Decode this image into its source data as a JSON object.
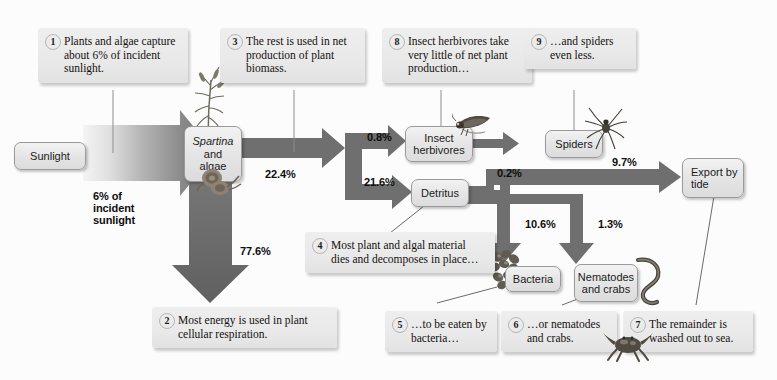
{
  "diagram": {
    "colors": {
      "arrow_dark": "#6b6b6b",
      "arrow_mid": "#7d7d7d",
      "node_fill": "#e7e7e7",
      "node_border": "#9a9a9a",
      "callout_fill": "#e9e9e9",
      "text": "#1b1b1b",
      "background": "#fcfcfc"
    }
  },
  "nodes": [
    {
      "id": "sunlight",
      "label": "Sunlight"
    },
    {
      "id": "spartina",
      "label_italic": "Spartina",
      "label_rest": "and algae"
    },
    {
      "id": "insects",
      "label": "Insect herbivores"
    },
    {
      "id": "spiders",
      "label": "Spiders"
    },
    {
      "id": "detritus",
      "label": "Detritus"
    },
    {
      "id": "export",
      "label": "Export by tide"
    },
    {
      "id": "bacteria",
      "label": "Bacteria"
    },
    {
      "id": "nematodes",
      "label": "Nematodes and crabs"
    }
  ],
  "flows": [
    {
      "id": "sunlight-to-plants",
      "label": "6% of\nincident\nsunlight",
      "from": "sunlight",
      "to": "spartina"
    },
    {
      "id": "net-production",
      "label": "22.4%",
      "from": "spartina",
      "to": "split"
    },
    {
      "id": "respiration",
      "label": "77.6%",
      "from": "spartina",
      "to": "respiration"
    },
    {
      "id": "to-insects",
      "label": "0.8%",
      "from": "split",
      "to": "insects"
    },
    {
      "id": "to-detritus",
      "label": "21.6%",
      "from": "split",
      "to": "detritus"
    },
    {
      "id": "to-spiders",
      "label": "0.2%",
      "from": "insects",
      "to": "spiders"
    },
    {
      "id": "to-export",
      "label": "9.7%",
      "from": "detritus",
      "to": "export"
    },
    {
      "id": "to-bacteria",
      "label": "10.6%",
      "from": "detritus",
      "to": "bacteria"
    },
    {
      "id": "to-nematodes",
      "label": "1.3%",
      "from": "detritus",
      "to": "nematodes"
    }
  ],
  "callouts": [
    {
      "num": "1",
      "text": "Plants and algae capture about 6% of incident sunlight."
    },
    {
      "num": "2",
      "text": "Most energy is used in plant cellular respiration."
    },
    {
      "num": "3",
      "text": "The rest is used in net production of plant biomass."
    },
    {
      "num": "4",
      "text": "Most plant and algal material dies and decomposes in place…"
    },
    {
      "num": "5",
      "text": "…to be eaten by bacteria…"
    },
    {
      "num": "6",
      "text": "…or nematodes and crabs."
    },
    {
      "num": "7",
      "text": "The remainder is washed out to sea."
    },
    {
      "num": "8",
      "text": "Insect herbivores take very little of net plant production…"
    },
    {
      "num": "9",
      "text": "…and spiders even less."
    }
  ],
  "artwork": [
    {
      "id": "grass-plant",
      "name": "spartina-grass-illustration"
    },
    {
      "id": "snail",
      "name": "snail-illustration"
    },
    {
      "id": "planthopper",
      "name": "insect-herbivore-illustration"
    },
    {
      "id": "spider",
      "name": "spider-illustration"
    },
    {
      "id": "bacteria-blob",
      "name": "bacteria-colony-illustration"
    },
    {
      "id": "nematode-worm",
      "name": "nematode-illustration"
    },
    {
      "id": "crab",
      "name": "crab-illustration"
    }
  ]
}
